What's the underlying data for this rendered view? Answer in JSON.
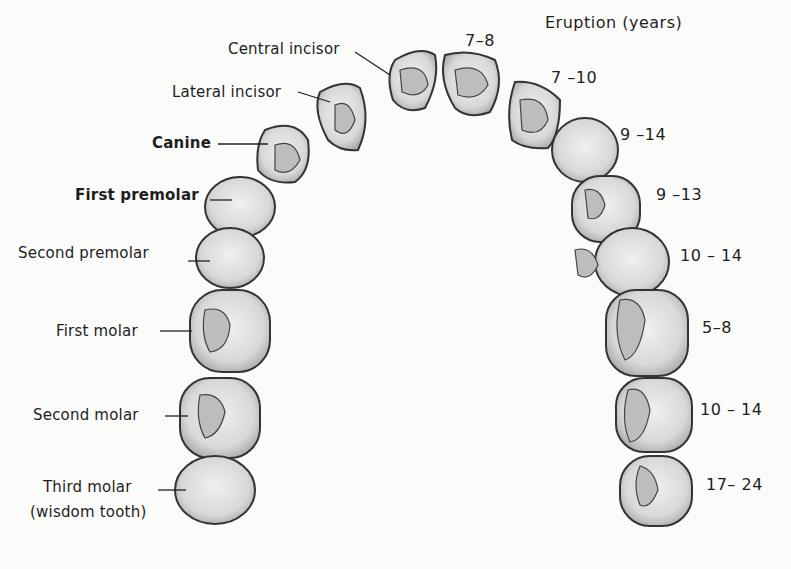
{
  "header": {
    "eruption_title": "Eruption (years)"
  },
  "left_labels": [
    {
      "name": "Central incisor"
    },
    {
      "name": "Lateral incisor"
    },
    {
      "name": "Canine"
    },
    {
      "name": "First premolar"
    },
    {
      "name": "Second premolar"
    },
    {
      "name": "First molar"
    },
    {
      "name": "Second molar"
    },
    {
      "name": "Third molar",
      "note": "(wisdom tooth)"
    }
  ],
  "eruption_ages": [
    {
      "tooth": "Central incisor",
      "years": "7–8"
    },
    {
      "tooth": "Lateral incisor",
      "years": "7 –10"
    },
    {
      "tooth": "Canine",
      "years": "9 –14"
    },
    {
      "tooth": "First premolar",
      "years": "9 –13"
    },
    {
      "tooth": "Second premolar",
      "years": "10 – 14"
    },
    {
      "tooth": "First molar",
      "years": "5–8"
    },
    {
      "tooth": "Second molar",
      "years": "10 – 14"
    },
    {
      "tooth": "Third molar",
      "years": "17– 24"
    }
  ],
  "colors": {
    "tooth_fill": "#e6e6e4",
    "tooth_shade": "#b8b8b6",
    "outline": "#3a3a3a"
  }
}
